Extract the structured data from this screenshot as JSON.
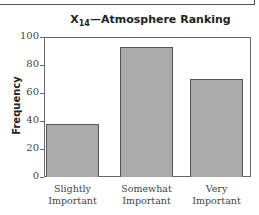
{
  "chart_data": {
    "type": "bar",
    "title": "X14—Atmosphere Ranking",
    "title_parts": {
      "var": "X",
      "sub": "14",
      "rest": "—Atmosphere Ranking"
    },
    "xlabel": "",
    "ylabel": "Frequency",
    "categories": [
      "Slightly Important",
      "Somewhat Important",
      "Very Important"
    ],
    "category_lines": [
      [
        "Slightly",
        "Important"
      ],
      [
        "Somewhat",
        "Important"
      ],
      [
        "Very",
        "Important"
      ]
    ],
    "values": [
      38,
      93,
      70
    ],
    "ylim": [
      0,
      100
    ],
    "yticks": [
      0,
      20,
      40,
      60,
      80,
      100
    ],
    "grid": false,
    "bar_color": "#aaaaaa",
    "edge_color": "#555555"
  }
}
